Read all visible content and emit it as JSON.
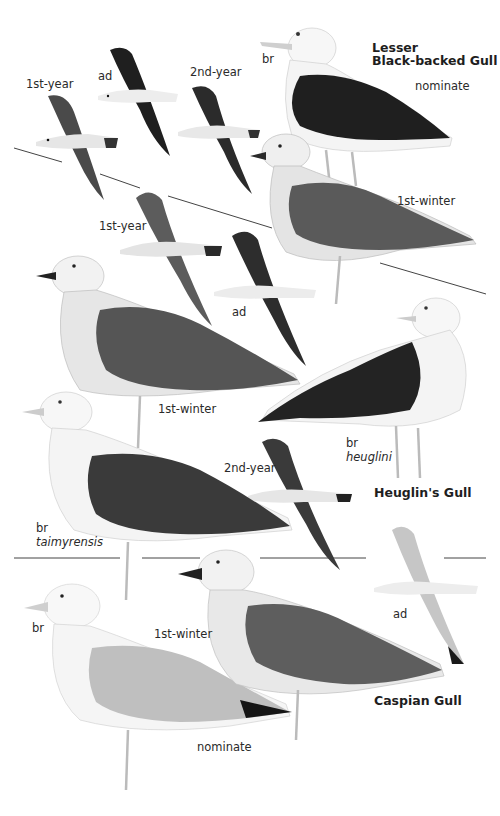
{
  "plate": {
    "species": [
      {
        "name_line1": "Lesser",
        "name_line2": "Black-backed Gull",
        "subspecies_label": "nominate",
        "figures": [
          {
            "label": "1st-year",
            "pose": "flight"
          },
          {
            "label": "ad",
            "pose": "flight"
          },
          {
            "label": "2nd-year",
            "pose": "flight"
          },
          {
            "label": "br",
            "pose": "standing"
          },
          {
            "label": "1st-winter",
            "pose": "standing"
          },
          {
            "label": "1st-year",
            "pose": "flight"
          },
          {
            "label": "ad",
            "pose": "flight"
          }
        ]
      },
      {
        "name": "Heuglin's Gull",
        "figures": [
          {
            "label": "1st-winter",
            "pose": "standing"
          },
          {
            "label": "br",
            "subspecies": "heuglini",
            "pose": "standing"
          },
          {
            "label": "2nd-year",
            "pose": "flight"
          },
          {
            "label": "br",
            "subspecies": "taimyrensis",
            "pose": "standing"
          }
        ]
      },
      {
        "name": "Caspian Gull",
        "subspecies_label": "nominate",
        "figures": [
          {
            "label": "br",
            "pose": "standing"
          },
          {
            "label": "1st-winter",
            "pose": "standing"
          },
          {
            "label": "ad",
            "pose": "flight"
          }
        ]
      }
    ]
  },
  "colors": {
    "background": "#ffffff",
    "mantle_dark": "#262626",
    "mantle_mid": "#3c3c3c",
    "mantle_pale": "#bdbdbd",
    "juvenile_brown": "#6e6e6e",
    "body_white": "#f6f6f6",
    "legs": "#b9b9b9",
    "divider": "#444444"
  }
}
